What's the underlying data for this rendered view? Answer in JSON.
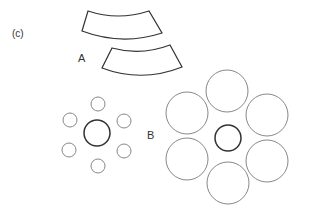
{
  "panel_label": "(c)",
  "labels": {
    "a": "A",
    "b": "B"
  },
  "colors": {
    "outline": "#333333",
    "thin_circle": "#888888",
    "center_circle": "#333333",
    "background": "#ffffff"
  },
  "group_a": {
    "description": "Two annular sector (arc segment) shapes, one offset below-right of the other",
    "segments": [
      {
        "name": "upper",
        "corners": {
          "tl": [
            88,
            11
          ],
          "tr": [
            149,
            11
          ],
          "br": [
            162,
            33
          ],
          "bl": [
            82,
            31
          ]
        }
      },
      {
        "name": "lower",
        "corners": {
          "tl": [
            112,
            48
          ],
          "tr": [
            170,
            45
          ],
          "br": [
            182,
            67
          ],
          "bl": [
            102,
            68
          ]
        }
      }
    ]
  },
  "group_b_small": {
    "center": {
      "cx": 97,
      "cy": 133,
      "r": 13
    },
    "satellites_r": 7,
    "satellites": [
      {
        "cx": 98,
        "cy": 104
      },
      {
        "cx": 124,
        "cy": 121
      },
      {
        "cx": 124,
        "cy": 151
      },
      {
        "cx": 98,
        "cy": 166
      },
      {
        "cx": 69,
        "cy": 150
      },
      {
        "cx": 70,
        "cy": 120
      }
    ]
  },
  "group_b_large": {
    "center": {
      "cx": 228,
      "cy": 138,
      "r": 13
    },
    "satellites_r": 21,
    "satellites": [
      {
        "cx": 227,
        "cy": 91
      },
      {
        "cx": 267,
        "cy": 115
      },
      {
        "cx": 267,
        "cy": 161
      },
      {
        "cx": 228,
        "cy": 183
      },
      {
        "cx": 187,
        "cy": 159
      },
      {
        "cx": 187,
        "cy": 113
      }
    ]
  }
}
